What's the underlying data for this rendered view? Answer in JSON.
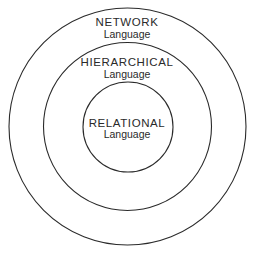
{
  "diagram": {
    "type": "nested-circles",
    "layers": [
      {
        "id": "network",
        "title": "NETWORK",
        "subtitle": "Language"
      },
      {
        "id": "hierarchical",
        "title": "HIERARCHICAL",
        "subtitle": "Language"
      },
      {
        "id": "relational",
        "title": "RELATIONAL",
        "subtitle": "Language"
      }
    ],
    "stroke_color": "#2a2a2a",
    "background": "#ffffff"
  }
}
